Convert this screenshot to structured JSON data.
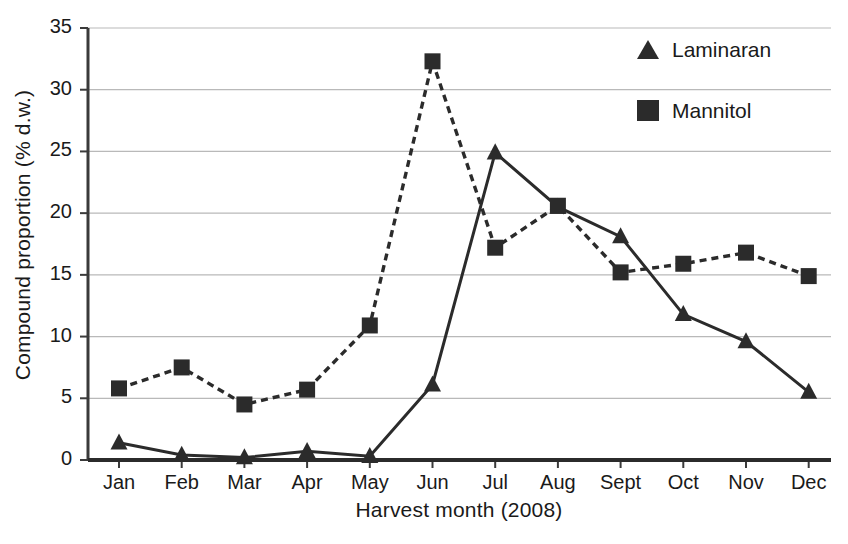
{
  "chart_data": {
    "type": "line",
    "title": "",
    "xlabel": "Harvest month (2008)",
    "ylabel": "Compound proportion (% d.w.)",
    "categories": [
      "Jan",
      "Feb",
      "Mar",
      "Apr",
      "May",
      "Jun",
      "Jul",
      "Aug",
      "Sept",
      "Oct",
      "Nov",
      "Dec"
    ],
    "series": [
      {
        "name": "Laminaran",
        "marker": "triangle",
        "linestyle": "solid",
        "color": "#2b2b2b",
        "values": [
          1.4,
          0.4,
          0.2,
          0.7,
          0.3,
          6.1,
          24.9,
          20.5,
          18.1,
          11.8,
          9.6,
          5.5
        ]
      },
      {
        "name": "Mannitol",
        "marker": "square",
        "linestyle": "dashed",
        "color": "#2b2b2b",
        "values": [
          5.8,
          7.5,
          4.5,
          5.7,
          10.9,
          32.3,
          17.2,
          20.6,
          15.2,
          15.9,
          16.8,
          14.9
        ]
      }
    ],
    "ylim": [
      0,
      35
    ],
    "yticks": [
      0,
      5,
      10,
      15,
      20,
      25,
      30,
      35
    ],
    "ytick_labels": [
      "0",
      "5",
      "10",
      "15",
      "20",
      "25",
      "30",
      "35"
    ],
    "grid": true,
    "grid_axis": "y",
    "legend_position": "top-right"
  },
  "legend": {
    "entries": [
      {
        "label": "Laminaran",
        "marker": "triangle"
      },
      {
        "label": "Mannitol",
        "marker": "square"
      }
    ]
  },
  "axes": {
    "y_title": "Compound proportion (% d.w.)",
    "x_title": "Harvest month (2008)"
  }
}
